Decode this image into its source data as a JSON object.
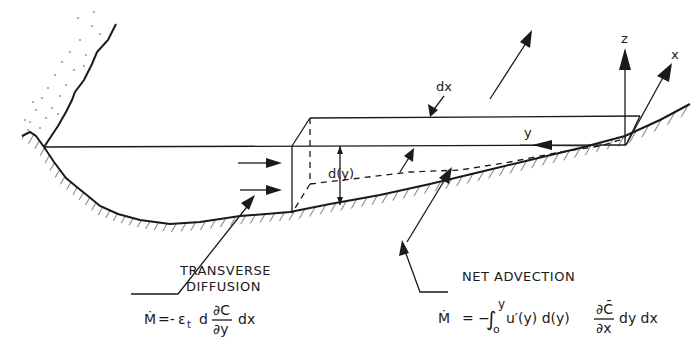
{
  "diagram": {
    "axes": {
      "z_label": "z",
      "x_label": "x",
      "y_label": "y"
    },
    "element": {
      "width_label": "dx",
      "depth_label": "d(y)"
    },
    "transverse_diffusion": {
      "title_line1": "TRANSVERSE",
      "title_line2": "DIFFUSION",
      "equation": {
        "lhs": "Ṁ",
        "eq": "=-",
        "coef": "ε",
        "coef_sub": "t",
        "d": "d",
        "frac_num": "∂C",
        "frac_den": "∂y",
        "tail": "dx"
      }
    },
    "net_advection": {
      "title": "NET ADVECTION",
      "equation": {
        "lhs": "Ṁ",
        "eq": "= −",
        "integral": "∫",
        "upper": "y",
        "lower": "o",
        "body": "u′(y) d(y)",
        "frac_num": "∂C̄",
        "frac_den": "∂x",
        "tail": "dy dx"
      }
    },
    "colors": {
      "ink": "#1a1a1a",
      "background": "#ffffff",
      "stipple": "#8a8a8a"
    }
  }
}
